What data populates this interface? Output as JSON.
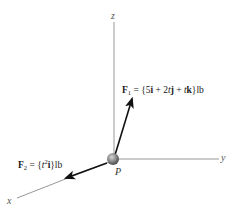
{
  "diagram": {
    "axes": {
      "x": {
        "label": "x"
      },
      "y": {
        "label": "y"
      },
      "z": {
        "label": "z"
      }
    },
    "point": {
      "label": "P",
      "color": "#8a8a8a"
    },
    "forces": [
      {
        "id": "F1",
        "symbol": "F",
        "subscript": "1",
        "equals": " = {",
        "terms": [
          "5",
          "i",
          " + 2",
          "t",
          "j",
          " + ",
          "t",
          "k"
        ],
        "close": "}",
        "unit": "lb",
        "full_text": "F1 = {5i + 2tj + tk}lb"
      },
      {
        "id": "F2",
        "symbol": "F",
        "subscript": "2",
        "equals": " = {",
        "var": "t",
        "power": "2",
        "basis": "i",
        "close": "}",
        "unit": "lb",
        "full_text": "F2 = {t^2 i}lb"
      }
    ],
    "colors": {
      "axis": "#8c8c8c",
      "arrow": "#111111",
      "text": "#1a1a1a"
    }
  }
}
